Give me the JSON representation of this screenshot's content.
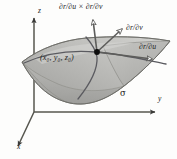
{
  "figure": {
    "surface_label": "σ",
    "point_label": "(x₀, y₀, z₀)",
    "axes": {
      "z_label": "z",
      "y_label": "y",
      "x_label": "x"
    },
    "vectors": [
      {
        "id": "normal",
        "label": "∂r/∂u × ∂r/∂v",
        "description": "normal vector pointing up from the surface point"
      },
      {
        "id": "partial_v",
        "label": "∂r/∂v",
        "description": "tangent vector along the v parameter curve"
      },
      {
        "id": "partial_u",
        "label": "∂r/∂u",
        "description": "tangent vector along the u parameter curve"
      }
    ],
    "colors": {
      "surface_fill": "#b3b3b0",
      "surface_fill_light": "#cfcfcc",
      "surface_edge": "#6e6e6b",
      "axis": "#4a4a48",
      "vector": "#5a5a58",
      "curve": "#55555a",
      "point": "#101010",
      "background": "#fdfdfc",
      "text": "#1c1c1c"
    },
    "faint_caption": ""
  }
}
